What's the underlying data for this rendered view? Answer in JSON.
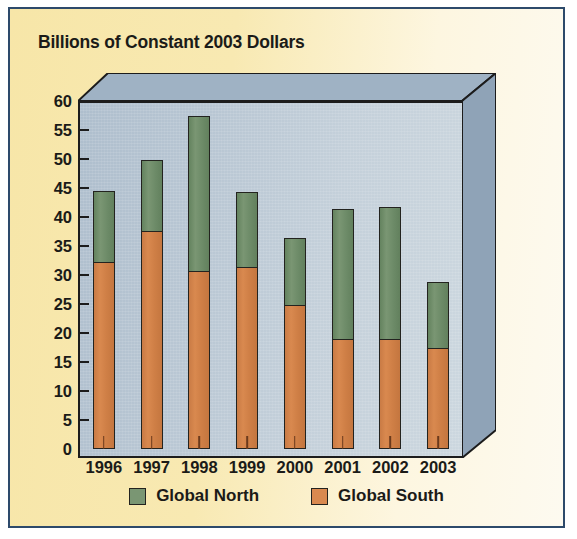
{
  "figure": {
    "title": "Billions of Constant 2003 Dollars",
    "border_color": "#2d4a6b",
    "panel_color": "#f7e6a8"
  },
  "legend": {
    "position": "bottom-center",
    "items": [
      {
        "label": "Global North",
        "color": "#7a9673",
        "swatch": "green-swatch"
      },
      {
        "label": "Global South",
        "color": "#d9894f",
        "swatch": "orange-swatch"
      }
    ]
  },
  "chart_data": {
    "type": "bar",
    "subtype": "stacked",
    "title": "Billions of Constant 2003 Dollars",
    "xlabel": "",
    "ylabel": "Billions of Constant 2003 Dollars",
    "ylim": [
      0,
      60
    ],
    "ytick_step": 5,
    "yticks": [
      0,
      5,
      10,
      15,
      20,
      25,
      30,
      35,
      40,
      45,
      50,
      55,
      60
    ],
    "ytick_labels": [
      "0",
      "5",
      "10",
      "15",
      "20",
      "25",
      "30",
      "35",
      "40",
      "45",
      "50",
      "55",
      "60"
    ],
    "categories": [
      "1996",
      "1997",
      "1998",
      "1999",
      "2000",
      "2001",
      "2002",
      "2003"
    ],
    "grid": false,
    "legend_position": "bottom-center",
    "series": [
      {
        "name": "Global South",
        "color": "#d9894f",
        "values": [
          32.3,
          37.7,
          30.7,
          31.5,
          24.9,
          19.0,
          19.0,
          17.4
        ]
      },
      {
        "name": "Global North",
        "color": "#7a9673",
        "values": [
          12.2,
          12.1,
          26.8,
          12.8,
          11.4,
          22.4,
          22.8,
          11.4
        ]
      }
    ],
    "totals": [
      44.5,
      49.8,
      57.5,
      44.3,
      36.3,
      41.4,
      41.8,
      28.8
    ]
  }
}
